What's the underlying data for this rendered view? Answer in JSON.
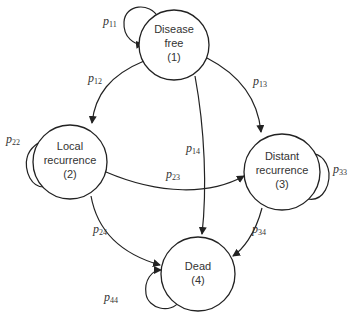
{
  "diagram": {
    "type": "markov-state-transition",
    "colors": {
      "stroke": "#222222",
      "text": "#333333",
      "background": "#ffffff"
    },
    "nodes": [
      {
        "id": "1",
        "lines": [
          "Disease",
          "free",
          "(1)"
        ]
      },
      {
        "id": "2",
        "lines": [
          "Local",
          "recurrence",
          "(2)"
        ]
      },
      {
        "id": "3",
        "lines": [
          "Distant",
          "recurrence",
          "(3)"
        ]
      },
      {
        "id": "4",
        "lines": [
          "Dead",
          "(4)"
        ]
      }
    ],
    "edges": [
      {
        "from": "1",
        "to": "1",
        "label": "p",
        "sub": "11"
      },
      {
        "from": "1",
        "to": "2",
        "label": "p",
        "sub": "12"
      },
      {
        "from": "1",
        "to": "3",
        "label": "p",
        "sub": "13"
      },
      {
        "from": "1",
        "to": "4",
        "label": "p",
        "sub": "14"
      },
      {
        "from": "2",
        "to": "2",
        "label": "p",
        "sub": "22"
      },
      {
        "from": "2",
        "to": "3",
        "label": "p",
        "sub": "23"
      },
      {
        "from": "2",
        "to": "4",
        "label": "p",
        "sub": "24"
      },
      {
        "from": "3",
        "to": "3",
        "label": "p",
        "sub": "33"
      },
      {
        "from": "3",
        "to": "4",
        "label": "p",
        "sub": "34"
      },
      {
        "from": "4",
        "to": "4",
        "label": "p",
        "sub": "44"
      }
    ]
  }
}
